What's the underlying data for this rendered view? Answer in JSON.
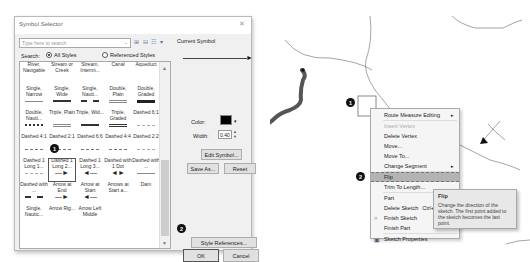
{
  "dialog": {
    "title": "Symbol Selector",
    "close_icon": "close-icon",
    "search": {
      "placeholder": "Type here to search",
      "dropdown_icon": "chevron-down-icon",
      "view_icons": "⊞ ⊟ ☷ ▾"
    },
    "search_label": "Search:",
    "radio_all": "All Styles",
    "radio_all_selected": true,
    "radio_referenced": "Referenced Styles",
    "gallery": {
      "items": [
        {
          "label": "River, Navigable",
          "glyph": "none"
        },
        {
          "label": "Stream or Creek",
          "glyph": "none"
        },
        {
          "label": "Stream, Intermi...",
          "glyph": "none"
        },
        {
          "label": "Canal",
          "glyph": "none"
        },
        {
          "label": "Aqueduct",
          "glyph": "none"
        },
        {
          "label": "Single, Narrow",
          "glyph": "single-narrow"
        },
        {
          "label": "Single, Wide",
          "glyph": "single-wide"
        },
        {
          "label": "Single, Nauti...",
          "glyph": "naut"
        },
        {
          "label": "Double, Plain",
          "glyph": "double-plain"
        },
        {
          "label": "Double, Graded",
          "glyph": "double-graded"
        },
        {
          "label": "Double, Nauti...",
          "glyph": "wavy"
        },
        {
          "label": "Triple, Plain",
          "glyph": "triple-plain"
        },
        {
          "label": "Triple, Wid...",
          "glyph": "triple-wid"
        },
        {
          "label": "Triple, Graded",
          "glyph": "triple-graded"
        },
        {
          "label": "Dashed 6:1",
          "glyph": "dash-light"
        },
        {
          "label": "Dashed 4:1",
          "glyph": "dash"
        },
        {
          "label": "Dashed 2:1",
          "glyph": "dash"
        },
        {
          "label": "Dashed 6:6",
          "glyph": "dash"
        },
        {
          "label": "Dashed 4:4",
          "glyph": "dash"
        },
        {
          "label": "Dashed 2:2",
          "glyph": "dash-light"
        },
        {
          "label": "Dashed 1 Long 1...",
          "glyph": "dash-light"
        },
        {
          "label": "Dashed 1 Long 2...",
          "glyph": "arrow-end",
          "selected": true
        },
        {
          "label": "Dashed 1 Long 3...",
          "glyph": "arrow-start"
        },
        {
          "label": "Dashed with 1 Dot",
          "glyph": "arrow-both"
        },
        {
          "label": "Dashed with ...",
          "glyph": "single-narrow"
        },
        {
          "label": "Dashed with ...",
          "glyph": "naut"
        },
        {
          "label": "Arrow at End",
          "glyph": "arrow-end"
        },
        {
          "label": "Arrow at Start",
          "glyph": "arrow-start"
        },
        {
          "label": "Arrows at Start a...",
          "glyph": "none"
        },
        {
          "label": "Dam",
          "glyph": "none"
        },
        {
          "label": "Single, Nautic...",
          "glyph": "none"
        },
        {
          "label": "Arrow Rig...",
          "glyph": "none"
        },
        {
          "label": "Arrow Left Middle",
          "glyph": "none"
        }
      ],
      "glyph_chars": {
        "arrow-end": "—►",
        "arrow-start": "◄—",
        "arrow-both": "◄►"
      }
    },
    "current_symbol_label": "Current Symbol",
    "color_label": "Color:",
    "color_value": "#000000",
    "width_label": "Width:",
    "width_value": "0.40",
    "edit_symbol_button": "Edit Symbol...",
    "save_as_button": "Save As...",
    "reset_button": "Reset",
    "style_references_button": "Style References...",
    "ok_button": "OK",
    "cancel_button": "Cancel",
    "badges": {
      "one": "1",
      "two": "2"
    }
  },
  "map": {
    "badges": {
      "one": "1",
      "two": "2"
    },
    "context_menu": {
      "items": [
        {
          "label": "Route Measure Editing",
          "submenu": true
        },
        {
          "label": "Insert Vertex",
          "disabled": true
        },
        {
          "label": "Delete Vertex"
        },
        {
          "label": "Move..."
        },
        {
          "label": "Move To..."
        },
        {
          "label": "Change Segment",
          "submenu": true
        },
        {
          "label": "Flip",
          "highlighted": true
        },
        {
          "label": "Trim To Length..."
        },
        {
          "label": "Part",
          "submenu": true
        },
        {
          "label": "Delete Sketch",
          "shortcut": "Ctrl+Del"
        },
        {
          "label": "Finish Sketch",
          "icon": "finish-sketch-icon"
        },
        {
          "label": "Finish Part"
        },
        {
          "label": "Sketch Properties",
          "icon": "sketch-properties-icon"
        }
      ]
    },
    "tooltip": {
      "title": "Flip",
      "body": "Change the direction of the sketch. The first point added to the sketch becomes the last point."
    }
  }
}
